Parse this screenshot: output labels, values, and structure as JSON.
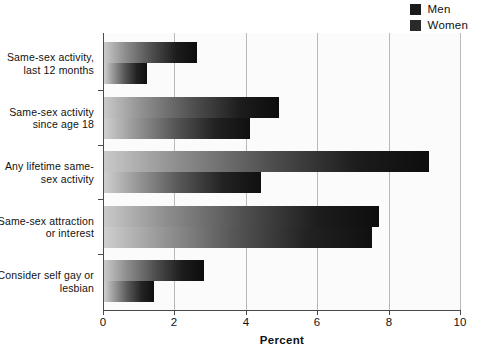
{
  "chart_data": {
    "type": "bar",
    "orientation": "horizontal",
    "title": "",
    "xlabel": "Percent",
    "ylabel": "",
    "xlim": [
      0,
      10
    ],
    "xticks": [
      0,
      2,
      4,
      6,
      8,
      10
    ],
    "xticklabels": [
      "0",
      "2",
      "4",
      "6",
      "8",
      "10"
    ],
    "grid": "vertical",
    "legend_position": "top-right",
    "categories": [
      "Same-sex activity, last 12 months",
      "Same-sex activity since age 18",
      "Any lifetime same-sex activity",
      "Same-sex attraction or interest",
      "Consider self gay or lesbian"
    ],
    "category_lines": [
      [
        "Same-sex activity,",
        "last 12 months"
      ],
      [
        "Same-sex activity",
        "since age 18"
      ],
      [
        "Any lifetime same-",
        "sex activity"
      ],
      [
        "Same-sex attraction",
        "or interest"
      ],
      [
        "Consider self gay or",
        "lesbian"
      ]
    ],
    "series": [
      {
        "name": "Men",
        "values": [
          2.6,
          4.9,
          9.1,
          7.7,
          2.8
        ]
      },
      {
        "name": "Women",
        "values": [
          1.2,
          4.1,
          4.4,
          7.5,
          1.4
        ]
      }
    ]
  },
  "legend": {
    "entries": [
      {
        "label": "Men",
        "color": "#1b1b1b"
      },
      {
        "label": "Women",
        "color": "#2a2a2a"
      }
    ]
  },
  "axis": {
    "x_label": "Percent",
    "tick_labels": [
      "0",
      "2",
      "4",
      "6",
      "8",
      "10"
    ]
  },
  "colors": {
    "men_bar_dark": "#0d0d0d",
    "men_bar_light": "#c9c9c9",
    "women_bar_dark": "#101010",
    "women_bar_light": "#cfcfcf",
    "gridline": "#b9b9b9",
    "axis": "#4a4a4a",
    "plot_background": "#fbfbfb"
  }
}
